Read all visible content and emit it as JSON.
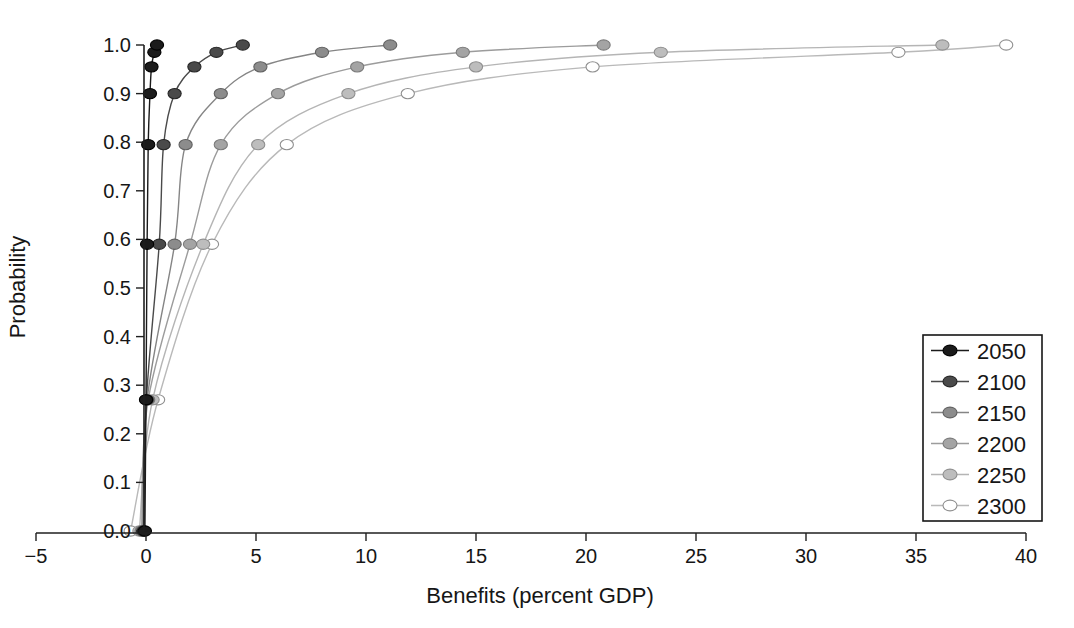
{
  "chart_data": {
    "type": "line",
    "subtype": "cumulative-distribution",
    "title": "",
    "xlabel": "Benefits (percent GDP)",
    "ylabel": "Probability",
    "xlim": [
      -5,
      40
    ],
    "ylim": [
      0.0,
      1.0
    ],
    "grid": false,
    "legend_position": "right-center-box",
    "x_axis": {
      "tick_values": [
        -5,
        0,
        5,
        10,
        15,
        20,
        25,
        30,
        35,
        40
      ],
      "tick_labels": [
        "−5",
        "0",
        "5",
        "10",
        "15",
        "20",
        "25",
        "30",
        "35",
        "40"
      ]
    },
    "y_axis": {
      "tick_values": [
        0.0,
        0.1,
        0.2,
        0.3,
        0.4,
        0.5,
        0.6,
        0.7,
        0.8,
        0.9,
        1.0
      ],
      "tick_labels": [
        "0.0",
        "0.1",
        "0.2",
        "0.3",
        "0.4",
        "0.5",
        "0.6",
        "0.7",
        "0.8",
        "0.9",
        "1.0"
      ]
    },
    "marker_probability_levels": [
      0.0,
      0.27,
      0.59,
      0.795,
      0.9,
      0.955,
      0.985,
      1.0
    ],
    "series": [
      {
        "name": "2050",
        "line_color": "#1b1b1b",
        "marker_fill": "#1b1b1b",
        "marker_stroke": "#000000",
        "x_at_levels": [
          -0.05,
          0.0,
          0.05,
          0.1,
          0.18,
          0.25,
          0.38,
          0.5
        ]
      },
      {
        "name": "2100",
        "line_color": "#4a4a4a",
        "marker_fill": "#4a4a4a",
        "marker_stroke": "#262626",
        "x_at_levels": [
          -0.1,
          0.02,
          0.6,
          0.8,
          1.3,
          2.2,
          3.2,
          4.4
        ]
      },
      {
        "name": "2150",
        "line_color": "#858585",
        "marker_fill": "#8c8c8c",
        "marker_stroke": "#616161",
        "x_at_levels": [
          -0.15,
          0.05,
          1.3,
          1.8,
          3.4,
          5.2,
          8.0,
          11.1
        ]
      },
      {
        "name": "2200",
        "line_color": "#9c9c9c",
        "marker_fill": "#a4a4a4",
        "marker_stroke": "#7b7b7b",
        "x_at_levels": [
          -0.2,
          0.1,
          2.0,
          3.4,
          6.0,
          9.6,
          14.4,
          20.8
        ]
      },
      {
        "name": "2250",
        "line_color": "#b5b5b5",
        "marker_fill": "#bdbdbd",
        "marker_stroke": "#8f8f8f",
        "x_at_levels": [
          -0.3,
          0.3,
          2.6,
          5.1,
          9.2,
          15.0,
          23.4,
          36.2
        ]
      },
      {
        "name": "2300",
        "line_color": "#b9b9b9",
        "marker_fill": "#ffffff",
        "marker_stroke": "#8f8f8f",
        "x_at_levels": [
          -0.7,
          0.55,
          3.0,
          6.4,
          11.9,
          20.3,
          34.2,
          39.1
        ]
      }
    ],
    "legend_entries": [
      "2050",
      "2100",
      "2150",
      "2200",
      "2250",
      "2300"
    ],
    "axis_color": "#1f1f1f",
    "background_color": "#ffffff"
  }
}
